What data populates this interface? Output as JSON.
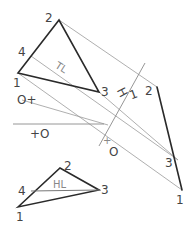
{
  "diagram": {
    "title": "",
    "type": "descriptive-geometry-edge-view",
    "top_view": {
      "points": {
        "1": {
          "label": "1",
          "x": 18,
          "y": 73
        },
        "2": {
          "label": "2",
          "x": 59,
          "y": 20
        },
        "3": {
          "label": "3",
          "x": 99,
          "y": 92
        },
        "4": {
          "label": "4",
          "x": 31,
          "y": 56
        }
      },
      "true_length_label": "TL"
    },
    "fold_lines": {
      "h1": {
        "label_left": "H",
        "label_right": "1"
      },
      "horizontal_marker_top": "O+",
      "horizontal_marker_bottom": "+O",
      "h1_marker": "+O"
    },
    "auxiliary_view": {
      "points": {
        "2": {
          "label": "2",
          "x": 157,
          "y": 87
        },
        "3": {
          "label": "3",
          "x": 178,
          "y": 160
        },
        "1": {
          "label": "1",
          "x": 182,
          "y": 190
        }
      }
    },
    "front_view": {
      "points": {
        "1": {
          "label": "1",
          "x": 18,
          "y": 207
        },
        "2": {
          "label": "2",
          "x": 60,
          "y": 168
        },
        "3": {
          "label": "3",
          "x": 99,
          "y": 190
        },
        "4": {
          "label": "4",
          "x": 31,
          "y": 191
        }
      },
      "horizontal_line_label": "HL"
    }
  }
}
